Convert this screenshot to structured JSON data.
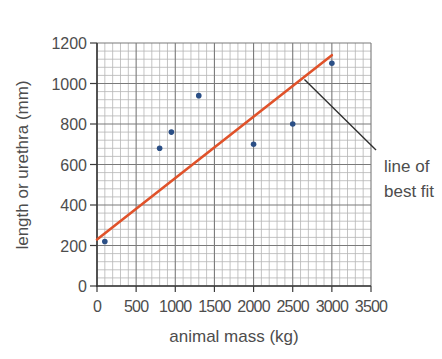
{
  "chart_data": {
    "type": "scatter",
    "title": "",
    "xlabel": "animal mass (kg)",
    "ylabel": "length or urethra (mm)",
    "xlim": [
      0,
      3500
    ],
    "ylim": [
      0,
      1200
    ],
    "x_ticks": [
      0,
      500,
      1000,
      1500,
      2000,
      2500,
      3000,
      3500
    ],
    "x_tick_labels": [
      "0",
      "500",
      "1000",
      "1500",
      "2000",
      "2500",
      "3000",
      "3500"
    ],
    "y_ticks": [
      0,
      200,
      400,
      600,
      800,
      1000,
      1200
    ],
    "y_tick_labels": [
      "0",
      "200",
      "400",
      "600",
      "800",
      "1000",
      "1200"
    ],
    "grid": true,
    "grid_minor_x_step": 100,
    "grid_minor_y_step": 40,
    "series": [
      {
        "name": "data points",
        "type": "scatter",
        "color": "#2b4f86",
        "points": [
          {
            "x": 100,
            "y": 220
          },
          {
            "x": 800,
            "y": 680
          },
          {
            "x": 950,
            "y": 760
          },
          {
            "x": 1300,
            "y": 940
          },
          {
            "x": 2000,
            "y": 700
          },
          {
            "x": 2500,
            "y": 800
          },
          {
            "x": 3000,
            "y": 1100
          }
        ]
      },
      {
        "name": "line of best fit",
        "type": "line",
        "color": "#e0522a",
        "points": [
          {
            "x": 0,
            "y": 230
          },
          {
            "x": 3000,
            "y": 1140
          }
        ]
      }
    ],
    "annotations": [
      {
        "text_lines": [
          "line of",
          "best fit"
        ],
        "points_to": {
          "x": 2650,
          "y": 1020
        }
      }
    ],
    "legend": null
  },
  "colors": {
    "axis": "#3a3a3a",
    "grid_major": "#7a7a7a",
    "grid_minor": "#b5b5b5",
    "text": "#4d4d4d",
    "annotation_line": "#2f2f2f"
  }
}
